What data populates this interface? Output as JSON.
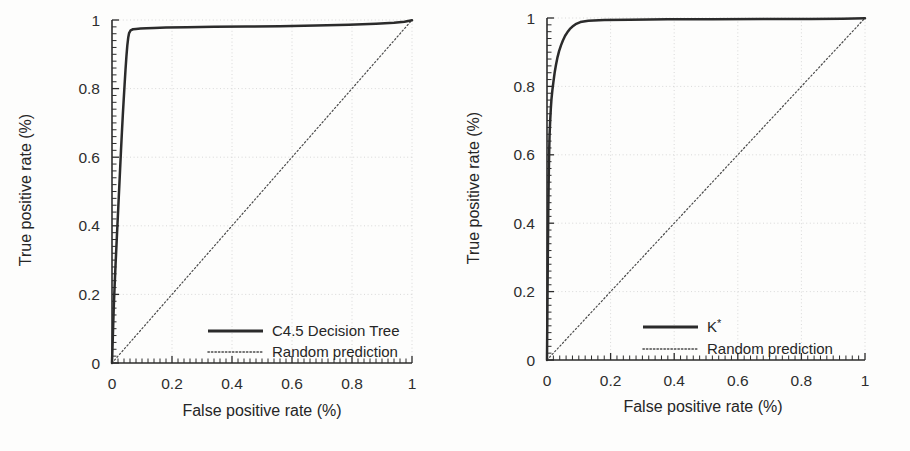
{
  "figure": {
    "background_color": "#fdfdfc",
    "ink_color": "#2b2b2b",
    "panel_count": 2
  },
  "chart_data": [
    {
      "type": "line",
      "title": "",
      "xlabel": "False positive rate (%)",
      "ylabel": "True positive rate (%)",
      "xlim": [
        0,
        1
      ],
      "ylim": [
        0,
        1
      ],
      "xticks": [
        "0",
        "0.2",
        "0.4",
        "0.6",
        "0.8",
        "1"
      ],
      "yticks": [
        "0",
        "0.2",
        "0.4",
        "0.6",
        "0.8",
        "1"
      ],
      "xtick_values": [
        0,
        0.2,
        0.4,
        0.6,
        0.8,
        1
      ],
      "ytick_values": [
        0,
        0.2,
        0.4,
        0.6,
        0.8,
        1
      ],
      "grid": true,
      "legend_position": "lower right",
      "series": [
        {
          "name": "C4.5 Decision Tree",
          "style": "solid",
          "color": "#2b2b2b",
          "x": [
            0.0,
            0.002,
            0.004,
            0.006,
            0.009,
            0.012,
            0.015,
            0.018,
            0.021,
            0.024,
            0.027,
            0.03,
            0.033,
            0.036,
            0.039,
            0.042,
            0.045,
            0.048,
            0.051,
            0.054,
            0.057,
            0.062,
            0.07,
            0.08,
            0.095,
            0.115,
            0.14,
            0.18,
            0.25,
            0.34,
            0.45,
            0.56,
            0.68,
            0.79,
            0.88,
            0.94,
            0.975,
            1.0
          ],
          "y": [
            0.0,
            0.055,
            0.11,
            0.165,
            0.23,
            0.29,
            0.345,
            0.4,
            0.455,
            0.51,
            0.565,
            0.62,
            0.672,
            0.722,
            0.768,
            0.812,
            0.855,
            0.893,
            0.925,
            0.948,
            0.962,
            0.97,
            0.973,
            0.974,
            0.975,
            0.976,
            0.977,
            0.978,
            0.979,
            0.98,
            0.981,
            0.982,
            0.984,
            0.986,
            0.989,
            0.992,
            0.995,
            0.999
          ]
        },
        {
          "name": "Random prediction",
          "style": "dotted",
          "color": "#4a4a4a",
          "x": [
            0,
            1
          ],
          "y": [
            0,
            1
          ]
        }
      ]
    },
    {
      "type": "line",
      "title": "",
      "xlabel": "False positive rate (%)",
      "ylabel": "True positive rate (%)",
      "xlim": [
        0,
        1
      ],
      "ylim": [
        0,
        1
      ],
      "xticks": [
        "0",
        "0.2",
        "0.4",
        "0.6",
        "0.8",
        "1"
      ],
      "yticks": [
        "0",
        "0.2",
        "0.4",
        "0.6",
        "0.8",
        "1"
      ],
      "xtick_values": [
        0,
        0.2,
        0.4,
        0.6,
        0.8,
        1
      ],
      "ytick_values": [
        0,
        0.2,
        0.4,
        0.6,
        0.8,
        1
      ],
      "grid": true,
      "legend_position": "lower right",
      "series": [
        {
          "name": "K*",
          "name_base": "K",
          "name_superscript": "*",
          "style": "solid",
          "color": "#2b2b2b",
          "x": [
            0.0,
            0.001,
            0.002,
            0.003,
            0.004,
            0.005,
            0.006,
            0.007,
            0.008,
            0.01,
            0.012,
            0.014,
            0.017,
            0.02,
            0.024,
            0.028,
            0.033,
            0.038,
            0.044,
            0.05,
            0.057,
            0.064,
            0.072,
            0.08,
            0.09,
            0.105,
            0.13,
            0.18,
            0.26,
            0.38,
            0.52,
            0.68,
            0.83,
            0.93,
            1.0
          ],
          "y": [
            0.0,
            0.12,
            0.235,
            0.34,
            0.43,
            0.505,
            0.565,
            0.615,
            0.655,
            0.7,
            0.735,
            0.762,
            0.79,
            0.812,
            0.84,
            0.862,
            0.885,
            0.903,
            0.92,
            0.934,
            0.948,
            0.958,
            0.968,
            0.975,
            0.982,
            0.988,
            0.992,
            0.994,
            0.995,
            0.996,
            0.996,
            0.997,
            0.997,
            0.998,
            0.999
          ]
        },
        {
          "name": "Random prediction",
          "style": "dotted",
          "color": "#4a4a4a",
          "x": [
            0,
            1
          ],
          "y": [
            0,
            1
          ]
        }
      ]
    }
  ],
  "panels": [
    {
      "id": "left",
      "xlabel": "False positive rate (%)",
      "ylabel": "True positive rate (%)",
      "xticks": [
        "0",
        "0.2",
        "0.4",
        "0.6",
        "0.8",
        "1"
      ],
      "yticks": [
        "0",
        "0.2",
        "0.4",
        "0.6",
        "0.8",
        "1"
      ],
      "legend": [
        {
          "label": "C4.5 Decision Tree",
          "style": "solid"
        },
        {
          "label": "Random prediction",
          "style": "dotted"
        }
      ]
    },
    {
      "id": "right",
      "xlabel": "False positive rate (%)",
      "ylabel": "True positive rate (%)",
      "xticks": [
        "0",
        "0.2",
        "0.4",
        "0.6",
        "0.8",
        "1"
      ],
      "yticks": [
        "0",
        "0.2",
        "0.4",
        "0.6",
        "0.8",
        "1"
      ],
      "legend": [
        {
          "label": "K*",
          "label_base": "K",
          "label_sup": "*",
          "style": "solid"
        },
        {
          "label": "Random prediction",
          "style": "dotted"
        }
      ]
    }
  ]
}
